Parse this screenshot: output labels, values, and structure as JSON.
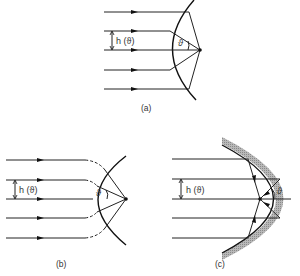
{
  "panels": [
    {
      "id": "a",
      "caption": "(a)",
      "height_label": "h (ϑ)",
      "angle_label": "ϑ",
      "description": "Parallel rays focused by spherical surface onto focal point"
    },
    {
      "id": "b",
      "caption": "(b)",
      "height_label": "h (ϑ)",
      "angle_label": "ϑ",
      "description": "Rays bent (dashed) onto spherical wavefront converging to focus"
    },
    {
      "id": "c",
      "caption": "(c)",
      "height_label": "h (ϑ)",
      "angle_label": "ϑ",
      "description": "Parabolic mirror reflecting parallel rays to focal point"
    }
  ],
  "colors": {
    "line": "#222222",
    "mirror_shade": "#9a9a9a",
    "background": "#ffffff"
  }
}
